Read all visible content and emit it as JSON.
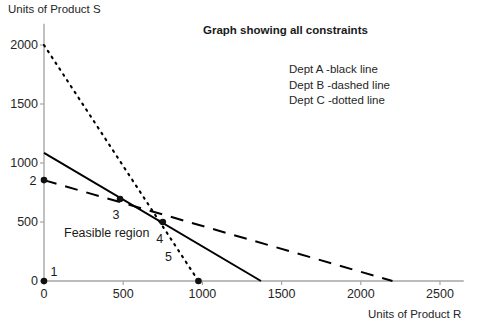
{
  "chart_data": {
    "type": "line",
    "title": "Graph showing all constraints",
    "xlabel": "Units of Product R",
    "ylabel": "Units of Product S",
    "xlim": [
      0,
      2650
    ],
    "ylim": [
      0,
      2120
    ],
    "grid": false,
    "legend_position": "top-right",
    "xticks": [
      0,
      500,
      1000,
      1500,
      2000,
      2500
    ],
    "xtick_labels": [
      "0",
      "500",
      "1000",
      "1500",
      "2000",
      "2500"
    ],
    "yticks": [
      0,
      500,
      1000,
      1500,
      2000
    ],
    "ytick_labels": [
      "0",
      "500",
      "1000",
      "1500",
      "2000"
    ],
    "series": [
      {
        "name": "Dept A -black line",
        "style": "solid",
        "color": "#000000",
        "x": [
          0,
          1370
        ],
        "y": [
          1085,
          0
        ]
      },
      {
        "name": "Dept B -dashed line",
        "style": "dashed",
        "color": "#000000",
        "x": [
          0,
          2200
        ],
        "y": [
          855,
          0
        ]
      },
      {
        "name": "Dept C -dotted line",
        "style": "dotted",
        "color": "#000000",
        "x": [
          0,
          975
        ],
        "y": [
          2000,
          0
        ]
      }
    ],
    "points": [
      {
        "label": "1",
        "x": 0,
        "y": 0,
        "label_dx": 10,
        "label_dy": -9
      },
      {
        "label": "2",
        "x": 0,
        "y": 855,
        "label_dx": -11,
        "label_dy": 1
      },
      {
        "label": "3",
        "x": 480,
        "y": 695,
        "label_dx": -4,
        "label_dy": 16
      },
      {
        "label": "4",
        "x": 750,
        "y": 500,
        "label_dx": -3,
        "label_dy": 17
      },
      {
        "label": "5",
        "x": 975,
        "y": 0,
        "label_dx": -30,
        "label_dy": -24
      }
    ],
    "annotations": [
      {
        "text": "Feasible region",
        "x": 130,
        "y": 420
      }
    ]
  },
  "legend": {
    "entries": [
      "Dept A -black line",
      "Dept B -dashed line",
      "Dept C -dotted line"
    ]
  }
}
